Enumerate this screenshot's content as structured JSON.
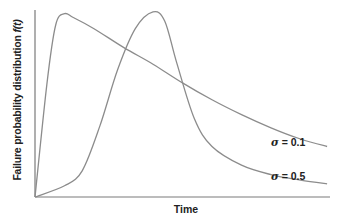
{
  "chart_data": {
    "type": "line",
    "title": "",
    "xlabel": "Time",
    "ylabel": "Failure probability distribution",
    "ylabel_suffix": "f(t)",
    "xlim": [
      0,
      1
    ],
    "ylim": [
      0,
      1
    ],
    "grid": false,
    "legend": "inline annotations",
    "series": [
      {
        "name": "σ = 0.1",
        "x": [
          0.0,
          0.04,
          0.07,
          0.1,
          0.13,
          0.2,
          0.3,
          0.4,
          0.5,
          0.6,
          0.7,
          0.8,
          0.9,
          0.99
        ],
        "y": [
          0.0,
          0.6,
          0.92,
          0.98,
          0.96,
          0.9,
          0.8,
          0.71,
          0.61,
          0.52,
          0.44,
          0.37,
          0.31,
          0.27
        ]
      },
      {
        "name": "σ = 0.5",
        "x": [
          0.0,
          0.1,
          0.16,
          0.22,
          0.28,
          0.34,
          0.4,
          0.44,
          0.48,
          0.54,
          0.6,
          0.7,
          0.8,
          0.9,
          0.99
        ],
        "y": [
          0.0,
          0.06,
          0.14,
          0.38,
          0.68,
          0.9,
          0.99,
          0.94,
          0.72,
          0.42,
          0.27,
          0.17,
          0.12,
          0.09,
          0.07
        ]
      }
    ],
    "annotations": [
      {
        "text": "σ = 0.1",
        "series": "σ = 0.1"
      },
      {
        "text": "σ = 0.5",
        "series": "σ = 0.5"
      }
    ]
  },
  "labels": {
    "xlabel": "Time",
    "ylabel": "Failure probability distribution ",
    "ylabel_fn": "f(t)",
    "sigma_symbol": "σ",
    "annot_1_value": " = 0.1",
    "annot_2_value": " = 0.5"
  },
  "colors": {
    "curve": "#8c8c8c",
    "axis": "#7a7a7a",
    "text": "#222222"
  }
}
